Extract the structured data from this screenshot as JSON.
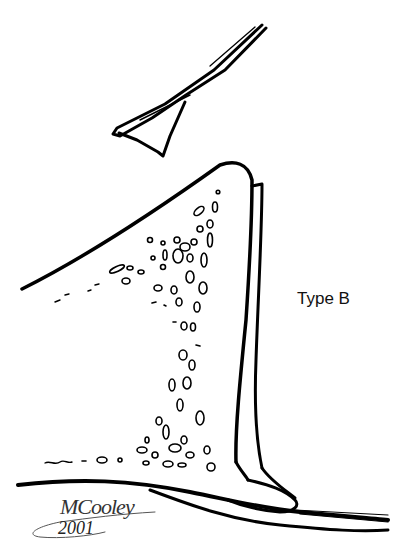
{
  "figure": {
    "label": "Type B",
    "signature": {
      "name": "MCooley",
      "year": "2001"
    },
    "colors": {
      "ink": "#000000",
      "background": "#ffffff"
    }
  }
}
